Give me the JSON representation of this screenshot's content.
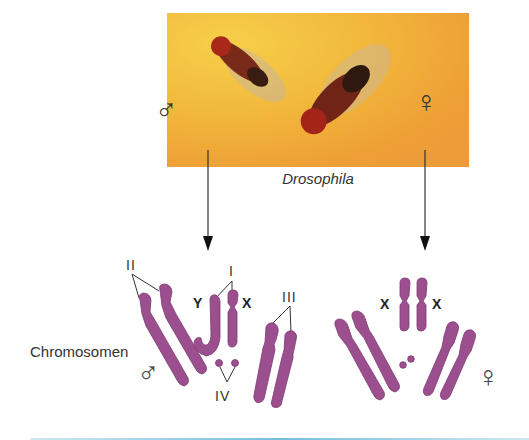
{
  "figure": {
    "photo": {
      "caption": "Drosophila",
      "male_symbol": "♂",
      "female_symbol": "♀",
      "background_color": "#f2b83c"
    },
    "labels": {
      "chromosomes": "Chromosomen",
      "pair_II": "II",
      "pair_I": "I",
      "pair_III": "III",
      "pair_IV": "IV",
      "y": "Y",
      "x_male": "X",
      "x_female_left": "X",
      "x_female_right": "X",
      "male_symbol": "♂",
      "female_symbol": "♀"
    },
    "colors": {
      "chromosome": "#9b4f8e",
      "chromosome_dark": "#7f3b73",
      "line": "#333333",
      "rule": "#74bfd9"
    }
  }
}
